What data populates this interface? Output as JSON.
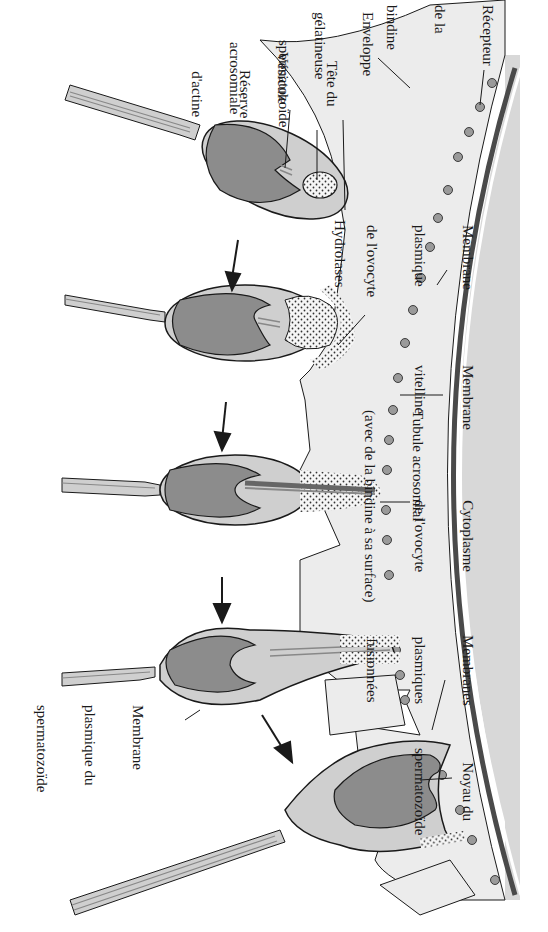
{
  "diagram": {
    "orientation": "rotated 90° clockwise",
    "colors": {
      "cytoplasm": "#d8d8d8",
      "jelly_coat": "#ececec",
      "vitelline_membrane": "#4a4a4a",
      "nucleus": "#8c8c8c",
      "sperm_head": "#cfcfcf",
      "receptor": "#9a9a9a",
      "outline": "#1a1a1a"
    },
    "stages_count": 5
  },
  "labels": {
    "recepteur": [
      "Récepteur",
      "de la",
      "bindine"
    ],
    "enveloppe": [
      "Enveloppe",
      "gélatineuse"
    ],
    "tete": [
      "Tête du",
      "spermatozoïde"
    ],
    "vesicule": [
      "Vésicule",
      "acrosomiale"
    ],
    "reserve": [
      "Réserve",
      "d'actine"
    ],
    "hydrolases": [
      "Hydrolases"
    ],
    "membrane_ovocyte": [
      "Membrane",
      "plasmique",
      "de l'ovocyte"
    ],
    "membrane_vitelline": [
      "Membrane",
      "vitelline"
    ],
    "tubule": [
      "Tubule acrosomial",
      "(avec de la bindine à sa surface)"
    ],
    "cytoplasme": [
      "Cytoplasme",
      "de l'ovocyte"
    ],
    "membranes_fusionnees": [
      "Membranes",
      "plasmiques",
      "fusionnées"
    ],
    "noyau": [
      "Noyau du",
      "spermatozoïde"
    ],
    "membrane_sperm": [
      "Membrane",
      "plasmique du",
      "spermatozoïde"
    ]
  }
}
